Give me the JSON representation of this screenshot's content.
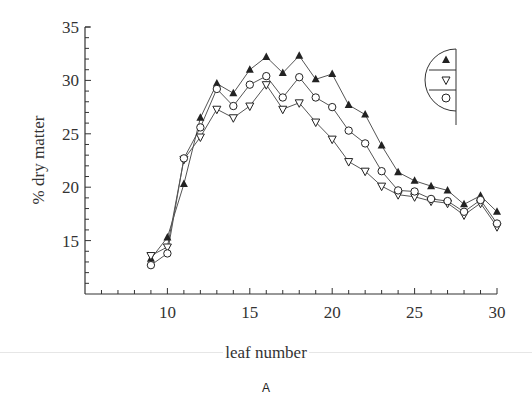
{
  "chart_data": {
    "type": "line",
    "title": "",
    "panel_label": "A",
    "xlabel": "leaf number",
    "ylabel": "% dry matter",
    "xlim": [
      5,
      30
    ],
    "ylim": [
      10,
      35
    ],
    "x_ticks": [
      10,
      15,
      20,
      25,
      30
    ],
    "y_ticks": [
      15,
      20,
      25,
      30,
      35
    ],
    "grid": false,
    "legend_position": "upper right (half-circle key)",
    "x": [
      9,
      10,
      11,
      12,
      13,
      14,
      15,
      16,
      17,
      18,
      19,
      20,
      21,
      22,
      23,
      24,
      25,
      26,
      27,
      28,
      29,
      30
    ],
    "series": [
      {
        "name": "filled triangle",
        "marker": "filled-triangle-up",
        "values": [
          13.3,
          15.3,
          20.3,
          26.5,
          29.7,
          28.8,
          31.0,
          32.2,
          30.7,
          32.3,
          30.1,
          30.6,
          27.7,
          26.8,
          23.9,
          21.4,
          20.6,
          20.1,
          19.7,
          18.4,
          19.2,
          17.7
        ]
      },
      {
        "name": "open inverted triangle",
        "marker": "open-triangle-down",
        "values": [
          13.6,
          14.4,
          22.6,
          24.7,
          27.3,
          26.5,
          27.6,
          29.6,
          27.3,
          27.9,
          26.1,
          24.5,
          22.4,
          21.5,
          20.1,
          19.3,
          19.1,
          18.7,
          18.5,
          17.4,
          18.5,
          16.3
        ]
      },
      {
        "name": "open circle",
        "marker": "open-circle",
        "values": [
          12.7,
          13.8,
          22.7,
          25.6,
          29.2,
          27.6,
          29.6,
          30.4,
          28.4,
          30.3,
          28.4,
          27.5,
          25.3,
          24.1,
          21.5,
          19.7,
          19.6,
          18.9,
          18.7,
          17.7,
          18.8,
          16.6
        ]
      }
    ]
  },
  "labels": {
    "xlabel": "leaf number",
    "ylabel": "% dry matter",
    "panel": "A"
  },
  "colors": {
    "line": "#555555",
    "marker": "#222222",
    "axis": "#333333",
    "separator": "#e6e6e6"
  }
}
